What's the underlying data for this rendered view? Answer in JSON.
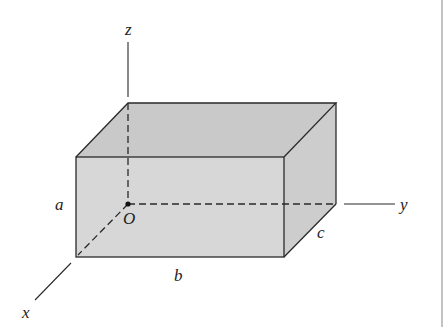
{
  "diagram": {
    "type": "rectangular-box-in-3d-coordinates",
    "colors": {
      "top_face": "#c9c9c9",
      "front_face": "#d7d7d7",
      "side_face": "#cdcdcd",
      "edge": "#2a2a2a",
      "right_border": "#9a9a9a"
    },
    "axes": {
      "x": "x",
      "y": "y",
      "z": "z"
    },
    "origin_label": "O",
    "dimensions": {
      "height": "a",
      "length": "b",
      "depth": "c"
    }
  }
}
